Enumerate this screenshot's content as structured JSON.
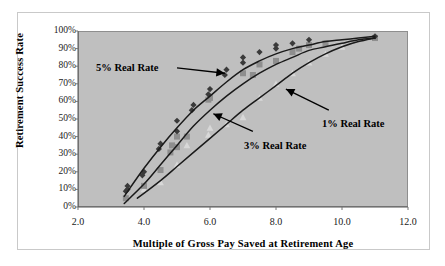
{
  "chart_data": {
    "type": "scatter",
    "title": "",
    "xlabel": "Multiple of Gross Pay Saved at Retirement Age",
    "ylabel": "Retirement Success Rate",
    "xlim": [
      2.0,
      12.0
    ],
    "ylim": [
      0,
      100
    ],
    "xticks": [
      "2.0",
      "4.0",
      "6.0",
      "8.0",
      "10.0",
      "12.0"
    ],
    "xtick_values": [
      2.0,
      4.0,
      6.0,
      8.0,
      10.0,
      12.0
    ],
    "yticks": [
      "0%",
      "10%",
      "20%",
      "30%",
      "40%",
      "50%",
      "60%",
      "70%",
      "80%",
      "90%",
      "100%"
    ],
    "ytick_values": [
      0,
      10,
      20,
      30,
      40,
      50,
      60,
      70,
      80,
      90,
      100
    ],
    "grid": false,
    "legend_position": "none",
    "plot_background": "#bfbfbf",
    "series": [
      {
        "name": "5% Real Rate",
        "marker": "diamond",
        "color": "#3a3a3a",
        "points": [
          [
            3.45,
            9
          ],
          [
            3.5,
            12
          ],
          [
            3.5,
            10
          ],
          [
            3.95,
            18
          ],
          [
            4.0,
            20
          ],
          [
            4.45,
            33
          ],
          [
            4.5,
            36
          ],
          [
            5.0,
            43
          ],
          [
            5.0,
            49
          ],
          [
            5.45,
            55
          ],
          [
            5.5,
            58
          ],
          [
            5.95,
            64
          ],
          [
            6.0,
            67
          ],
          [
            6.45,
            75
          ],
          [
            6.5,
            78
          ],
          [
            7.0,
            85
          ],
          [
            7.0,
            82
          ],
          [
            7.5,
            88
          ],
          [
            8.0,
            90
          ],
          [
            8.0,
            92
          ],
          [
            8.5,
            93
          ],
          [
            9.0,
            95
          ],
          [
            11.0,
            97
          ]
        ],
        "fit": [
          [
            3.4,
            6
          ],
          [
            4.0,
            22
          ],
          [
            4.5,
            34
          ],
          [
            5.0,
            45
          ],
          [
            5.5,
            55
          ],
          [
            6.0,
            63
          ],
          [
            6.5,
            71
          ],
          [
            7.0,
            78
          ],
          [
            7.5,
            83
          ],
          [
            8.0,
            87
          ],
          [
            8.5,
            90
          ],
          [
            9.0,
            92
          ],
          [
            9.5,
            94
          ],
          [
            10.0,
            95
          ],
          [
            10.5,
            96
          ],
          [
            11.0,
            97
          ]
        ]
      },
      {
        "name": "3% Real Rate",
        "marker": "square",
        "color": "#8e8e8e",
        "points": [
          [
            3.45,
            5
          ],
          [
            4.0,
            12
          ],
          [
            4.5,
            21
          ],
          [
            4.8,
            31
          ],
          [
            4.85,
            35
          ],
          [
            5.0,
            34
          ],
          [
            5.0,
            40
          ],
          [
            5.3,
            40
          ],
          [
            5.95,
            61
          ],
          [
            6.0,
            62
          ],
          [
            7.0,
            76
          ],
          [
            7.3,
            75
          ],
          [
            7.5,
            81
          ],
          [
            8.0,
            83
          ],
          [
            8.5,
            88
          ],
          [
            8.7,
            90
          ],
          [
            9.0,
            92
          ],
          [
            9.5,
            93
          ],
          [
            11.0,
            96
          ]
        ],
        "fit": [
          [
            3.4,
            2
          ],
          [
            4.0,
            13
          ],
          [
            4.5,
            24
          ],
          [
            5.0,
            35
          ],
          [
            5.5,
            46
          ],
          [
            6.0,
            55
          ],
          [
            6.5,
            63
          ],
          [
            7.0,
            70
          ],
          [
            7.5,
            76
          ],
          [
            8.0,
            81
          ],
          [
            8.5,
            85
          ],
          [
            9.0,
            89
          ],
          [
            9.5,
            91
          ],
          [
            10.0,
            93
          ],
          [
            10.5,
            95
          ],
          [
            11.0,
            96
          ]
        ]
      },
      {
        "name": "1% Real Rate",
        "marker": "triangle",
        "color": "#d8d8d8",
        "points": [
          [
            4.0,
            10
          ],
          [
            4.5,
            14
          ],
          [
            5.0,
            24
          ],
          [
            5.3,
            35
          ],
          [
            5.95,
            41
          ],
          [
            6.0,
            45
          ],
          [
            6.5,
            47
          ],
          [
            7.0,
            51
          ],
          [
            7.5,
            62
          ],
          [
            8.0,
            70
          ],
          [
            8.5,
            76
          ],
          [
            9.0,
            82
          ],
          [
            9.5,
            87
          ],
          [
            10.0,
            91
          ],
          [
            11.0,
            96
          ]
        ],
        "fit": [
          [
            3.8,
            5
          ],
          [
            4.5,
            15
          ],
          [
            5.0,
            23
          ],
          [
            5.5,
            31
          ],
          [
            6.0,
            39
          ],
          [
            6.5,
            47
          ],
          [
            7.0,
            55
          ],
          [
            7.5,
            62
          ],
          [
            8.0,
            69
          ],
          [
            8.5,
            76
          ],
          [
            9.0,
            82
          ],
          [
            9.5,
            87
          ],
          [
            10.0,
            91
          ],
          [
            10.5,
            94
          ],
          [
            11.0,
            96
          ]
        ]
      }
    ],
    "annotations": [
      {
        "text": "5% Real Rate",
        "arrow_from": [
          5.0,
          79
        ],
        "arrow_to": [
          6.45,
          76
        ]
      },
      {
        "text": "1% Real Rate",
        "arrow_from": [
          9.6,
          55
        ],
        "arrow_to": [
          8.3,
          67
        ]
      },
      {
        "text": "3% Real Rate",
        "arrow_from": [
          7.3,
          43
        ],
        "arrow_to": [
          6.1,
          53
        ]
      }
    ]
  }
}
